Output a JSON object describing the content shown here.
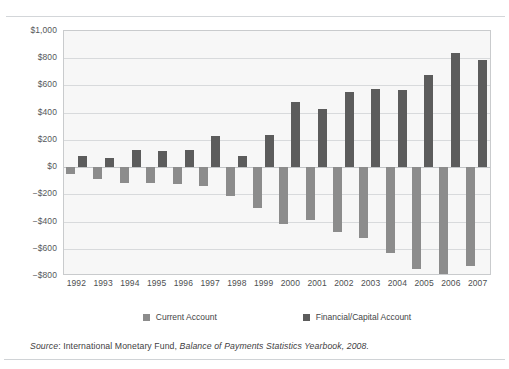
{
  "figure": {
    "source_prefix": "Source",
    "source_sep": ": ",
    "source_org": "International Monetary Fund, ",
    "source_title": "Balance of Payments Statistics Yearbook, 2008.",
    "colors": {
      "current_account": "#8c8c8c",
      "financial_capital_account": "#5c5c5c",
      "plot_background": "#f7f7f7",
      "gridline": "#d8dadc",
      "axis_border": "#c9cbcd"
    }
  },
  "legend": {
    "position": "bottom",
    "items": [
      {
        "label": "Current Account",
        "swatch": "current-account-swatch"
      },
      {
        "label": "Financial/Capital Account",
        "swatch": "financial-capital-account-swatch"
      }
    ]
  },
  "chart_data": {
    "type": "bar",
    "title": "",
    "subtitle": "",
    "xlabel": "",
    "ylabel": "",
    "grid": true,
    "legend_position": "bottom",
    "units": "US$ billions",
    "categories": [
      "1992",
      "1993",
      "1994",
      "1995",
      "1996",
      "1997",
      "1998",
      "1999",
      "2000",
      "2001",
      "2002",
      "2003",
      "2004",
      "2005",
      "2006",
      "2007"
    ],
    "ylim": [
      -800,
      1000
    ],
    "ytick_values": [
      1000,
      800,
      600,
      400,
      200,
      0,
      -200,
      -400,
      -600,
      -800
    ],
    "ytick_labels": [
      "$1,000",
      "$800",
      "$600",
      "$400",
      "$200",
      "$0",
      "−$200",
      "−$400",
      "−$600",
      "−$800"
    ],
    "series": [
      {
        "name": "Current Account",
        "color": "#8c8c8c",
        "values": [
          -50,
          -85,
          -120,
          -115,
          -125,
          -140,
          -215,
          -300,
          -415,
          -390,
          -475,
          -520,
          -630,
          -745,
          -800,
          -730
        ]
      },
      {
        "name": "Financial/Capital Account",
        "color": "#5c5c5c",
        "values": [
          80,
          70,
          125,
          120,
          125,
          230,
          80,
          235,
          475,
          425,
          550,
          575,
          565,
          680,
          840,
          790
        ]
      }
    ]
  }
}
